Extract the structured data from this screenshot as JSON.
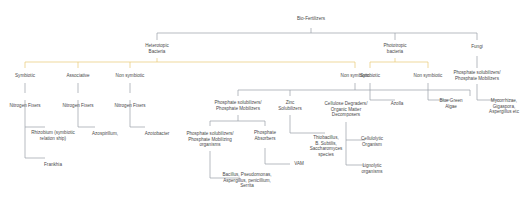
{
  "diagram": {
    "title": "Bio-Fertilizers",
    "nodes": {
      "root": "Bio-Fertilizers",
      "heterotropic": [
        "Heterotopic",
        "Bacteria"
      ],
      "phototropic": [
        "Phototropic",
        "bacteria"
      ],
      "fungi": "Fungi",
      "h_symbiotic": "Symbiotic",
      "h_associative": "Associative",
      "h_nonsymbiotic_1": "Non symbiotic",
      "h_nonsymbiotic_2": "Non symbiotic",
      "nf1": "Nitrogen Fixers",
      "nf2": "Nitrogen Fixers",
      "nf3": "Nitrogen Fixers",
      "rhizobium": [
        "Rhizobium (symbiotic",
        "relation ship)"
      ],
      "frankia": "Frankhia",
      "azospirillum": "Azospirillum,",
      "azotobacter": "Azotobacter",
      "psm": [
        "Phosphate solubilizers/",
        "Phosphate Mobilizers"
      ],
      "zinc": [
        "Zinc",
        "Solubilizers"
      ],
      "cellulose": [
        "Cellulose Degraders/",
        "Organic Matter",
        "Decomposers"
      ],
      "psm_org": [
        "Phosphate solubilizers/",
        "Phosphate Mobilizing",
        "organisms"
      ],
      "p_absorbers": [
        "Phosphate",
        "Absorbers"
      ],
      "bacillus": [
        "Bacillus, Pseudomonas,",
        "Aspergillus, penicillium,",
        "Serrita"
      ],
      "vam": "VAM",
      "thiobacillus": [
        "Thiobacillus,",
        "B. Subtilis,",
        "Saccharomyces",
        "species"
      ],
      "cellulolytic": [
        "Cellulolytic",
        "Organism"
      ],
      "lignolytic": [
        "Lignolytic",
        "organisms"
      ],
      "p_symbiotic": "Symbiotic",
      "p_nonsymbiotic": "Non symbiotic",
      "azolla": "Azolla",
      "bga": [
        "Blue Green",
        "Algae"
      ],
      "fungi_psm": [
        "Phosphate solubilizers/",
        "Phosphate Mobilizers"
      ],
      "mycorrhizae": [
        "Mycorrhizae,",
        "Gigaspora,",
        "Aspergillus etc"
      ]
    },
    "colors": {
      "edge_gray": "#9a9fa6",
      "edge_gold": "#e8c873",
      "arc": "#d9b25a",
      "text": "#4a4a4a"
    }
  }
}
